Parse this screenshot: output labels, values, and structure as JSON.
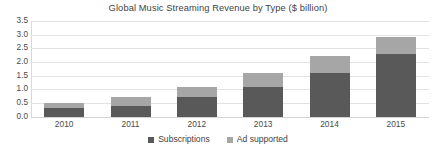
{
  "chart_data": {
    "type": "bar",
    "subtype": "stacked-bar",
    "title": "Global Music Streaming Revenue by Type ($ billion)",
    "xlabel": "",
    "ylabel": "",
    "categories": [
      "2010",
      "2011",
      "2012",
      "2013",
      "2014",
      "2015"
    ],
    "series": [
      {
        "name": "Subscriptions",
        "color": "#595959",
        "values": [
          0.3,
          0.4,
          0.7,
          1.1,
          1.6,
          2.3
        ]
      },
      {
        "name": "Ad supported",
        "color": "#a6a6a6",
        "values": [
          0.2,
          0.3,
          0.4,
          0.5,
          0.6,
          0.6
        ]
      }
    ],
    "totals": [
      0.5,
      0.7,
      1.1,
      1.6,
      2.2,
      2.9
    ],
    "ylim": [
      0.0,
      3.5
    ],
    "ytick_step": 0.5,
    "ytick_labels": [
      "3.5",
      "3.0",
      "2.5",
      "2.0",
      "1.5",
      "1.0",
      "0.5",
      "0.0"
    ],
    "ytick_values": [
      3.5,
      3.0,
      2.5,
      2.0,
      1.5,
      1.0,
      0.5,
      0.0
    ],
    "grid": true,
    "grid_axis": "y",
    "legend_position": "bottom",
    "legend": [
      "Subscriptions",
      "Ad supported"
    ]
  },
  "colors": {
    "subscriptions": "#595959",
    "ad_supported": "#a6a6a6",
    "gridline": "#e2e2e2",
    "text": "#3f3f3f",
    "background": "#ffffff"
  }
}
